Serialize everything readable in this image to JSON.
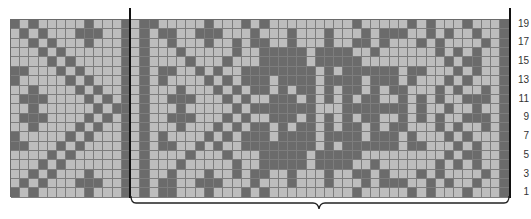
{
  "chart": {
    "title": "",
    "columns": 54,
    "rows": 19,
    "colors": {
      "dark": "#6b6b6b",
      "light": "#bdbdbd",
      "gridline": "#7d7d7d",
      "rule": "#111111"
    },
    "row_labels": [
      "19",
      "17",
      "15",
      "13",
      "11",
      "9",
      "7",
      "5",
      "3",
      "1"
    ],
    "pattern_rows_top_to_bottom": [
      "X.X.....X...X.XX.....X...X.X.........X.....X.X...X...X",
      ".X.X...XXX..X.X.XX..XXX...X...X...X...X.XXX..X.X..X..X",
      "..X.X...X...X.X..X...X..X.XX..X...X..XX.X...X.X....X.X",
      "...X.X......X.X...X.....X..XXXXX.XXXX..X......X.X.X..X",
      "....X.X.....X.X....X...X...XXXXX.XXXXX.........X.XX..X",
      "XX...X.X....X.X.XX..X.X..XXXXXXXX.X.XXXXXX.XX...X.X..X",
      "X.....X.X...X.X.X....X.X.XXX.XXXX.XXXX.XXX.X...X.X...X",
      "..X....X.X..X.X...X...X.X.XX.X.XX.X.XX.X.XX...X.X..X.X",
      ".XXX....X.X.X.X..XXX...X.X..XXX.X.X.X.XX..X.X.X..XXX.X",
      "..X......X.XX.X...X.....X.XXXXXXX...XXXXXXX.X..X..X..X",
      ".XXX....X.X.X.X..XXX...X.X..XXX.X.X.X.XX..X.X.X..XXX.X",
      "..X....X.X..X.X...X...X.X.XX.X.XX.X.XX.X.XX...X.X..X.X",
      "X.....X.X...X.X.X....X.X.XXX.XXXX.XXXX.XXX.X...X.X...X",
      "XX...X.X....X.X.XX..X.X..XXXXXXXX.X.XXXXXX.XX...X.X..X",
      "....X.X.....X.X....X...X...XXXXX.XXXXX.........X.XX..X",
      "...X.X......X.X...X.....X..XXXXX.XXXX..X......X.X.X..X",
      "..X.X...X...X.X..X...X..X.XX..X...X..XX.X...X.X....X.X",
      ".X.X...XXX..X.X.XX..XXX...X...X...X...X.XXX..X.X..X..X",
      "X.X.....X...X.X.XX...X...X.X.........X.....X.X...X...X"
    ],
    "repeat_bracket": {
      "start_col": 13,
      "end_col": 53
    }
  }
}
